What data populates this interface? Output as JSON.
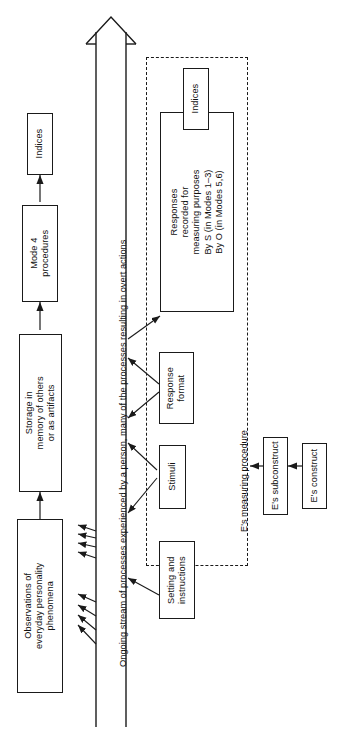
{
  "figure": {
    "orientation": "rotated-90-ccw",
    "background_color": "#ffffff",
    "line_color": "#1a1a1a",
    "text_color": "#111111"
  },
  "stream": {
    "label": "Ongoing stream of processes experienced by a person, many of the processes resulting in overt actions",
    "arrowhead": "open-triangle-arrowhead"
  },
  "nodes": {
    "observations": "Observations of\neveryday personality\nphenomena",
    "storage": "Storage in\nmemory of others\nor as artifacts",
    "mode4": "Mode 4\nprocedures",
    "indices_top": "Indices",
    "setting": "Setting and\ninstructions",
    "stimuli": "Stimuli",
    "response_format": "Response\nformat",
    "responses_recorded": "Responses\nrecorded for\nmeasuring purposes\nBy S (in Modes 1–3)\nBy O (in Modes 5,6)",
    "indices_measuring": "Indices",
    "subconstruct": "E's subconstruct",
    "construct": "E's construct"
  },
  "annotations": {
    "measuring_procedure": "E's measuring procedure"
  }
}
